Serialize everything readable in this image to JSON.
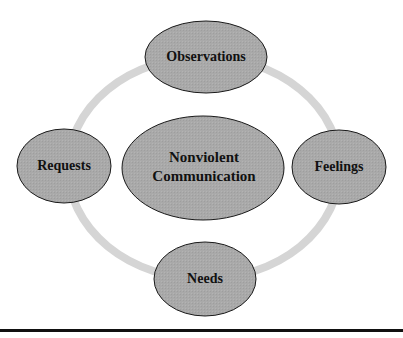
{
  "diagram": {
    "title": "Nonviolent Communication",
    "center": {
      "lines": [
        "Nonviolent",
        "Communication"
      ]
    },
    "nodes": [
      {
        "id": "observations",
        "label": "Observations"
      },
      {
        "id": "feelings",
        "label": "Feelings"
      },
      {
        "id": "needs",
        "label": "Needs"
      },
      {
        "id": "requests",
        "label": "Requests"
      }
    ],
    "colors": {
      "ellipse_fill": "#a9a9a9",
      "ellipse_stroke": "#1a1a1a",
      "ring": "#d5d5d5",
      "text": "#111111",
      "rule": "#111111"
    }
  }
}
